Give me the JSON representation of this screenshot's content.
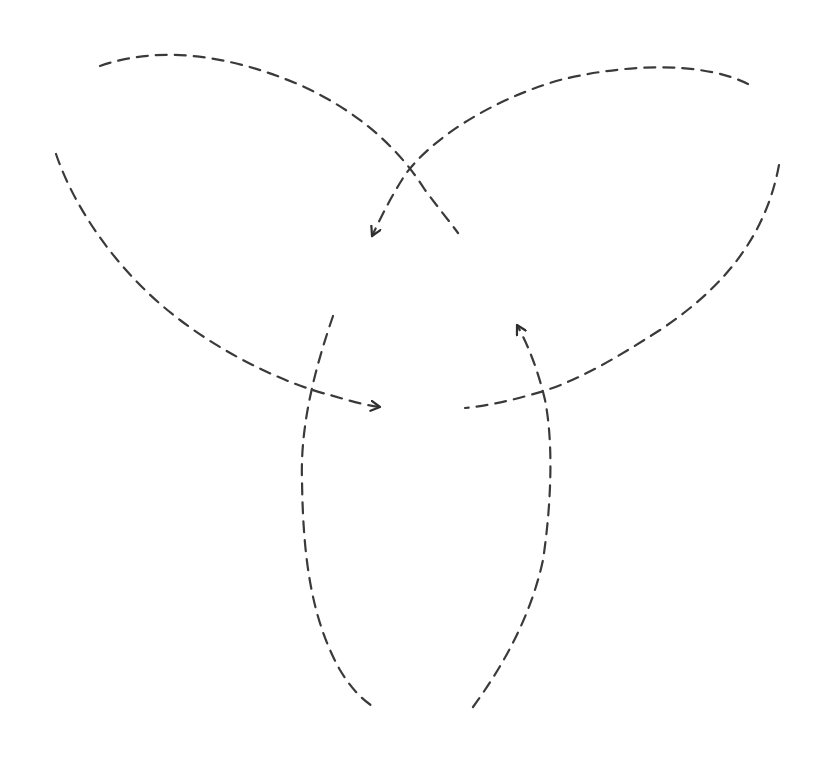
{
  "diagram": {
    "type": "knot-diagram",
    "stroke_color": "#3a3a3a",
    "background": "#ffffff",
    "strands": [
      {
        "id": "top-left-arc",
        "from": [
          100,
          66
        ],
        "to": [
          458,
          233
        ],
        "arrow": false
      },
      {
        "id": "top-right-arc",
        "from": [
          748,
          84
        ],
        "to": [
          372,
          236
        ],
        "arrow": true,
        "arrow_at": "end"
      },
      {
        "id": "left-lower-arc",
        "from": [
          56,
          154
        ],
        "to": [
          380,
          407
        ],
        "arrow": true,
        "arrow_at": "end"
      },
      {
        "id": "right-lower-arc",
        "from": [
          779,
          165
        ],
        "to": [
          465,
          408
        ],
        "arrow": false
      },
      {
        "id": "bottom-left-loop",
        "from": [
          333,
          316
        ],
        "to": [
          375,
          708
        ],
        "arrow": false
      },
      {
        "id": "bottom-right-loop",
        "from": [
          473,
          707
        ],
        "to": [
          517,
          325
        ],
        "arrow": true,
        "arrow_at": "end"
      }
    ],
    "crossings": [
      {
        "at": [
          412,
          183
        ],
        "over": "top-right-arc",
        "under": "top-left-arc"
      },
      {
        "at": [
          309,
          390
        ],
        "over": "left-lower-arc",
        "under": "bottom-left-loop"
      },
      {
        "at": [
          540,
          392
        ],
        "over": "right-lower-arc",
        "under": "bottom-right-loop"
      }
    ]
  }
}
